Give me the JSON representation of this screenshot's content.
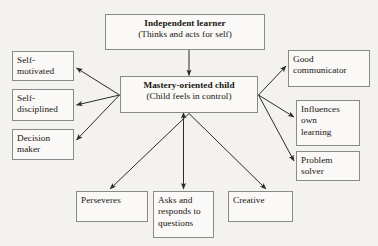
{
  "diagram": {
    "background_color": "#f4f2ef",
    "box_border_color": "#8a8a8a",
    "box_fill_color": "#faf9f7",
    "arrow_color": "#2b2b2b",
    "nodes": {
      "independent_learner": {
        "title": "Independent learner",
        "subtitle": "(Thinks and acts for self)"
      },
      "mastery_oriented_child": {
        "title": "Mastery-oriented child",
        "subtitle": "(Child feels in control)"
      },
      "self_motivated": {
        "line1": "Self-",
        "line2": "motivated"
      },
      "self_disciplined": {
        "line1": "Self-",
        "line2": "disciplined"
      },
      "decision_maker": {
        "line1": "Decision",
        "line2": "maker"
      },
      "good_communicator": {
        "line1": "Good",
        "line2": "communicator"
      },
      "influences_own_learning": {
        "line1": "Influences",
        "line2": "own",
        "line3": "learning"
      },
      "problem_solver": {
        "line1": "Problem",
        "line2": "solver"
      },
      "perseveres": {
        "line1": "Perseveres"
      },
      "asks_and_responds": {
        "line1": "Asks and",
        "line2": "responds to",
        "line3": "questions"
      },
      "creative": {
        "line1": "Creative"
      }
    }
  }
}
